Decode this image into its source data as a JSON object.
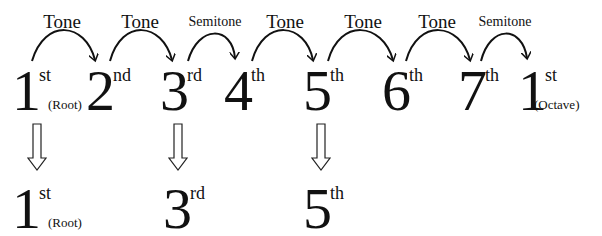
{
  "scale": {
    "steps": [
      {
        "label": "Tone",
        "size": "large"
      },
      {
        "label": "Tone",
        "size": "large"
      },
      {
        "label": "Semitone",
        "size": "small"
      },
      {
        "label": "Tone",
        "size": "large"
      },
      {
        "label": "Tone",
        "size": "large"
      },
      {
        "label": "Tone",
        "size": "large"
      },
      {
        "label": "Semitone",
        "size": "small"
      }
    ],
    "degrees": [
      {
        "num": "1",
        "sup": "st",
        "sub": "(Root)"
      },
      {
        "num": "2",
        "sup": "nd",
        "sub": ""
      },
      {
        "num": "3",
        "sup": "rd",
        "sub": ""
      },
      {
        "num": "4",
        "sup": "th",
        "sub": ""
      },
      {
        "num": "5",
        "sup": "th",
        "sub": ""
      },
      {
        "num": "6",
        "sup": "th",
        "sub": ""
      },
      {
        "num": "7",
        "sup": "th",
        "sub": ""
      },
      {
        "num": "1",
        "sup": "st",
        "sub": "(Octave)"
      }
    ]
  },
  "chord": {
    "degrees": [
      {
        "num": "1",
        "sup": "st",
        "sub": "(Root)"
      },
      {
        "num": "3",
        "sup": "rd",
        "sub": ""
      },
      {
        "num": "5",
        "sup": "th",
        "sub": ""
      }
    ]
  },
  "colors": {
    "ink": "#111111",
    "background": "#ffffff"
  }
}
